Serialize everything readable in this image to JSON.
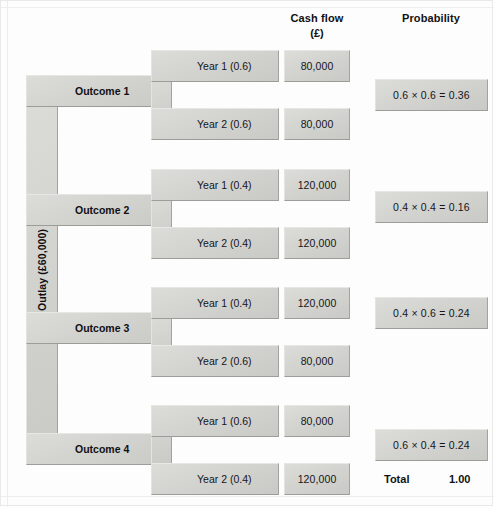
{
  "headers": {
    "cash_flow_line1": "Cash flow",
    "cash_flow_line2": "(£)",
    "probability": "Probability"
  },
  "trunk": {
    "label": "Outlay (£60,000)"
  },
  "outcomes": [
    {
      "name": "Outcome 1",
      "year1_label": "Year 1 (0.6)",
      "year1_cash": "80,000",
      "year2_label": "Year 2 (0.6)",
      "year2_cash": "80,000",
      "probability": "0.6 × 0.6 = 0.36"
    },
    {
      "name": "Outcome 2",
      "year1_label": "Year 1 (0.4)",
      "year1_cash": "120,000",
      "year2_label": "Year 2 (0.4)",
      "year2_cash": "120,000",
      "probability": "0.4 × 0.4 = 0.16"
    },
    {
      "name": "Outcome 3",
      "year1_label": "Year 1 (0.4)",
      "year1_cash": "120,000",
      "year2_label": "Year 2 (0.6)",
      "year2_cash": "80,000",
      "probability": "0.4 × 0.6 = 0.24"
    },
    {
      "name": "Outcome 4",
      "year1_label": "Year 1 (0.6)",
      "year1_cash": "80,000",
      "year2_label": "Year 2 (0.4)",
      "year2_cash": "120,000",
      "probability": "0.6 × 0.4 = 0.24"
    }
  ],
  "total": {
    "label": "Total",
    "value": "1.00"
  },
  "colors": {
    "plate_fill": "#d2d2cf",
    "plate_highlight": "#e7e7e4",
    "plate_shadow": "#9c9c99",
    "page_background": "#fdfdfd",
    "text": "#15151a"
  }
}
